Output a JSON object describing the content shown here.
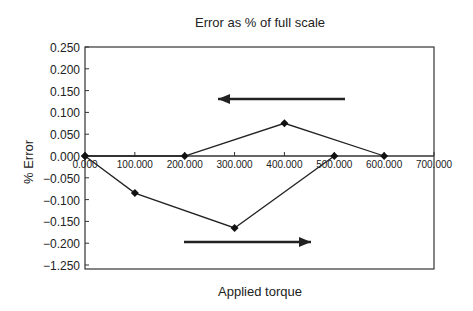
{
  "chart_data": {
    "type": "line",
    "title": "Error as % of full scale",
    "xlabel": "Applied torque",
    "ylabel": "% Error",
    "x": [
      0,
      100,
      200,
      300,
      400,
      500,
      600
    ],
    "series": [
      {
        "name": "Increasing torque",
        "direction": "right",
        "x": [
          0,
          100,
          300,
          500
        ],
        "values": [
          0.0,
          -0.085,
          -0.165,
          0.0
        ]
      },
      {
        "name": "Decreasing torque",
        "direction": "left",
        "x": [
          600,
          400,
          200,
          0
        ],
        "values": [
          0.0,
          0.075,
          0.0,
          0.0
        ]
      }
    ],
    "x_tick_labels": [
      "0.000",
      "100.000",
      "200.000",
      "300.000",
      "400.000",
      "500.000",
      "600.000",
      "700.000"
    ],
    "y_tick_labels": [
      "0.250",
      "0.200",
      "0.150",
      "0.100",
      "0.050",
      "0.000",
      "-0.050",
      "-0.100",
      "-0.150",
      "-0.200",
      "-1.250"
    ],
    "xlim": [
      0,
      700
    ],
    "ylim": [
      -0.25,
      0.25
    ],
    "grid": false,
    "legend": "none",
    "annotations": [
      {
        "type": "arrow",
        "direction": "left",
        "position": "upper, above rising peak"
      },
      {
        "type": "arrow",
        "direction": "right",
        "position": "lower, below minimum"
      }
    ]
  },
  "labels": {
    "title": "Error as % of full scale",
    "xlabel": "Applied torque",
    "ylabel": "% Error"
  },
  "style": {
    "line_color": "#222222",
    "marker_color": "#111111",
    "axis_color": "#333333"
  }
}
